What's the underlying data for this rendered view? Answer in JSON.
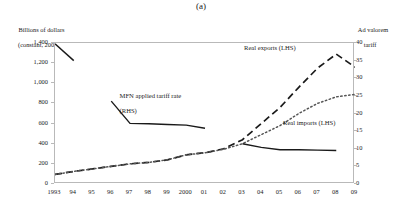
{
  "figure": {
    "panel_title": "(a)",
    "left_axis_title_line1": "Billions of dollars",
    "left_axis_title_line2": "(constant, 2000)",
    "right_axis_title_line1": "Ad valorem",
    "right_axis_title_line2": "tariff"
  },
  "labels": {
    "exports": "Real exports (LHS)",
    "imports": "Real imports (LHS)",
    "mfn_line1": "MFN applied tariff rate",
    "mfn_line2": "(RHS)"
  },
  "chart_data": {
    "type": "line",
    "title": "(a)",
    "xlabel": "",
    "ylabel": "Billions of dollars (constant, 2000)",
    "y2label": "Ad valorem tariff",
    "grid": false,
    "legend": "inline-annotations",
    "x": [
      "1993",
      "94",
      "95",
      "96",
      "97",
      "98",
      "99",
      "2000",
      "01",
      "02",
      "03",
      "04",
      "05",
      "06",
      "07",
      "08",
      "09"
    ],
    "xtick_labels": [
      "1993",
      "94",
      "95",
      "96",
      "97",
      "98",
      "99",
      "2000",
      "01",
      "02",
      "03",
      "04",
      "05",
      "06",
      "07",
      "08",
      "09"
    ],
    "ylim": [
      0,
      1400
    ],
    "yticks": [
      "0",
      "200",
      "400",
      "600",
      "800",
      "1,000",
      "1,200",
      "1,400"
    ],
    "ytick_values": [
      0,
      200,
      400,
      600,
      800,
      1000,
      1200,
      1400
    ],
    "y2lim": [
      0,
      40
    ],
    "y2ticks": [
      "0",
      "5",
      "10",
      "15",
      "20",
      "25",
      "30",
      "35",
      "40"
    ],
    "y2tick_values": [
      0,
      5,
      10,
      15,
      20,
      25,
      30,
      35,
      40
    ],
    "series": [
      {
        "name": "Real exports (LHS)",
        "axis": "left",
        "style": "long-dashed",
        "color": "#1a1a1a",
        "x": [
          "1993",
          "94",
          "95",
          "96",
          "97",
          "98",
          "99",
          "2000",
          "01",
          "02",
          "03",
          "04",
          "05",
          "06",
          "07",
          "08",
          "09"
        ],
        "values": [
          95,
          125,
          150,
          175,
          200,
          215,
          240,
          290,
          310,
          350,
          440,
          600,
          760,
          960,
          1150,
          1290,
          1160
        ]
      },
      {
        "name": "Real imports (LHS)",
        "axis": "left",
        "style": "dotted",
        "color": "#555555",
        "x": [
          "1993",
          "94",
          "95",
          "96",
          "97",
          "98",
          "99",
          "2000",
          "01",
          "02",
          "03",
          "04",
          "05",
          "06",
          "07",
          "08",
          "09"
        ],
        "values": [
          95,
          125,
          150,
          175,
          200,
          215,
          240,
          290,
          310,
          345,
          400,
          490,
          580,
          700,
          800,
          865,
          890
        ]
      },
      {
        "name": "MFN applied tariff rate (RHS)",
        "axis": "right",
        "style": "solid",
        "color": "#1a1a1a",
        "segments": [
          {
            "x": [
              "1993",
              "94"
            ],
            "values": [
              39.8,
              35.0
            ]
          },
          {
            "x": [
              "96",
              "97",
              "98",
              "99",
              "2000",
              "01"
            ],
            "values": [
              23.5,
              17.2,
              17.1,
              16.9,
              16.7,
              15.8
            ]
          },
          {
            "x": [
              "03",
              "04",
              "05",
              "06",
              "07",
              "08"
            ],
            "values": [
              11.4,
              10.4,
              9.7,
              9.7,
              9.6,
              9.5
            ]
          }
        ]
      }
    ]
  }
}
